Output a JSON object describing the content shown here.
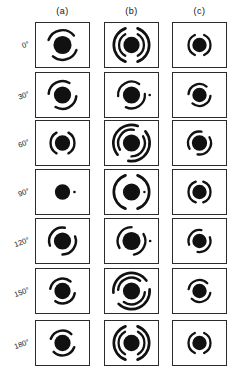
{
  "figure": {
    "type": "image-grid",
    "columns": [
      {
        "key": "a",
        "label": "(a)"
      },
      {
        "key": "b",
        "label": "(b)"
      },
      {
        "key": "c",
        "label": "(c)"
      }
    ],
    "rows": [
      {
        "angle_label": "0°"
      },
      {
        "angle_label": "30°"
      },
      {
        "angle_label": "60°"
      },
      {
        "angle_label": "90°"
      },
      {
        "angle_label": "120°"
      },
      {
        "angle_label": "150°"
      },
      {
        "angle_label": "180°"
      }
    ],
    "colors": {
      "ink": "#111111",
      "frame": "#2b2b2b",
      "background": "#ffffff"
    },
    "geometry": {
      "panel_width": 55,
      "panel_height": 46,
      "col_x": [
        35,
        104,
        172
      ],
      "row_y": [
        22,
        72,
        120,
        169,
        218,
        268,
        320
      ],
      "header_y": 6
    },
    "patterns": [
      {
        "row": 0,
        "col": "a",
        "core": 9.5,
        "rings": [
          {
            "r": 15.5,
            "w": 2.6,
            "start": 200,
            "sweep": 120
          },
          {
            "r": 15.5,
            "w": 2.6,
            "start": 20,
            "sweep": 110
          }
        ]
      },
      {
        "row": 0,
        "col": "b",
        "core": 8.5,
        "rings": [
          {
            "r": 13.0,
            "w": 2.4,
            "start": 120,
            "sweep": 120
          },
          {
            "r": 13.0,
            "w": 2.4,
            "start": 300,
            "sweep": 120
          },
          {
            "r": 18.5,
            "w": 2.8,
            "start": 110,
            "sweep": 140
          },
          {
            "r": 18.5,
            "w": 2.8,
            "start": 290,
            "sweep": 140
          }
        ]
      },
      {
        "row": 0,
        "col": "c",
        "core": 7.5,
        "rings": [
          {
            "r": 11.5,
            "w": 2.4,
            "start": 115,
            "sweep": 130
          },
          {
            "r": 11.5,
            "w": 2.4,
            "start": 295,
            "sweep": 130
          }
        ]
      },
      {
        "row": 1,
        "col": "a",
        "core": 9.0,
        "rings": [
          {
            "r": 14.5,
            "w": 2.6,
            "start": 185,
            "sweep": 115
          },
          {
            "r": 14.5,
            "w": 2.6,
            "start": 5,
            "sweep": 115
          }
        ]
      },
      {
        "row": 1,
        "col": "b",
        "core": 9.0,
        "rings": [
          {
            "r": 14.0,
            "w": 2.4,
            "start": 175,
            "sweep": 130
          },
          {
            "r": 14.0,
            "w": 2.4,
            "start": 355,
            "sweep": 120
          },
          {
            "r": 19.0,
            "w": 2.8,
            "start": 0,
            "sweep": 360
          }
        ]
      },
      {
        "row": 1,
        "col": "c",
        "core": 7.5,
        "rings": [
          {
            "r": 11.5,
            "w": 2.4,
            "start": 185,
            "sweep": 125
          },
          {
            "r": 11.5,
            "w": 2.4,
            "start": 5,
            "sweep": 125
          }
        ]
      },
      {
        "row": 2,
        "col": "a",
        "core": 8.0,
        "rings": [
          {
            "r": 12.5,
            "w": 2.5,
            "start": 120,
            "sweep": 120
          },
          {
            "r": 12.5,
            "w": 2.5,
            "start": 300,
            "sweep": 120
          }
        ]
      },
      {
        "row": 2,
        "col": "b",
        "core": 9.0,
        "rings": [
          {
            "r": 14.0,
            "w": 2.5,
            "start": 150,
            "sweep": 130
          },
          {
            "r": 14.0,
            "w": 2.5,
            "start": 330,
            "sweep": 120
          },
          {
            "r": 19.0,
            "w": 2.8,
            "start": 140,
            "sweep": 150
          },
          {
            "r": 19.0,
            "w": 2.8,
            "start": 320,
            "sweep": 140
          }
        ]
      },
      {
        "row": 2,
        "col": "c",
        "core": 8.0,
        "rings": [
          {
            "r": 12.0,
            "w": 2.4,
            "start": 150,
            "sweep": 130
          },
          {
            "r": 12.0,
            "w": 2.4,
            "start": 330,
            "sweep": 130
          }
        ]
      },
      {
        "row": 3,
        "col": "a",
        "core": 8.0,
        "rings": [
          {
            "r": 12.5,
            "w": 2.8,
            "start": 0,
            "sweep": 360
          }
        ]
      },
      {
        "row": 3,
        "col": "b",
        "core": 9.0,
        "rings": [
          {
            "r": 13.5,
            "w": 2.5,
            "start": 0,
            "sweep": 360
          },
          {
            "r": 18.5,
            "w": 2.8,
            "start": 110,
            "sweep": 140
          },
          {
            "r": 18.5,
            "w": 2.8,
            "start": 290,
            "sweep": 140
          }
        ]
      },
      {
        "row": 3,
        "col": "c",
        "core": 7.5,
        "rings": [
          {
            "r": 11.5,
            "w": 2.4,
            "start": 110,
            "sweep": 140
          },
          {
            "r": 11.5,
            "w": 2.4,
            "start": 290,
            "sweep": 140
          }
        ]
      },
      {
        "row": 4,
        "col": "a",
        "core": 9.0,
        "rings": [
          {
            "r": 14.0,
            "w": 2.6,
            "start": 160,
            "sweep": 120
          },
          {
            "r": 14.0,
            "w": 2.6,
            "start": 340,
            "sweep": 110
          }
        ]
      },
      {
        "row": 4,
        "col": "b",
        "core": 9.5,
        "rings": [
          {
            "r": 14.5,
            "w": 2.5,
            "start": 150,
            "sweep": 120
          },
          {
            "r": 14.5,
            "w": 2.5,
            "start": 330,
            "sweep": 110
          },
          {
            "r": 19.5,
            "w": 2.8,
            "start": 0,
            "sweep": 360
          }
        ]
      },
      {
        "row": 4,
        "col": "c",
        "core": 7.5,
        "rings": [
          {
            "r": 11.5,
            "w": 2.4,
            "start": 160,
            "sweep": 120
          },
          {
            "r": 11.5,
            "w": 2.4,
            "start": 340,
            "sweep": 120
          }
        ]
      },
      {
        "row": 5,
        "col": "a",
        "core": 8.5,
        "rings": [
          {
            "r": 13.0,
            "w": 2.6,
            "start": 190,
            "sweep": 120
          },
          {
            "r": 13.0,
            "w": 2.6,
            "start": 10,
            "sweep": 115
          }
        ]
      },
      {
        "row": 5,
        "col": "b",
        "core": 9.0,
        "rings": [
          {
            "r": 14.0,
            "w": 2.5,
            "start": 185,
            "sweep": 125
          },
          {
            "r": 14.0,
            "w": 2.5,
            "start": 5,
            "sweep": 120
          },
          {
            "r": 19.0,
            "w": 2.8,
            "start": 175,
            "sweep": 150
          },
          {
            "r": 19.0,
            "w": 2.8,
            "start": 355,
            "sweep": 140
          }
        ]
      },
      {
        "row": 5,
        "col": "c",
        "core": 7.5,
        "rings": [
          {
            "r": 11.5,
            "w": 2.4,
            "start": 190,
            "sweep": 125
          },
          {
            "r": 11.5,
            "w": 2.4,
            "start": 10,
            "sweep": 125
          }
        ]
      },
      {
        "row": 6,
        "col": "a",
        "core": 8.5,
        "rings": [
          {
            "r": 13.0,
            "w": 2.6,
            "start": 200,
            "sweep": 115
          },
          {
            "r": 13.0,
            "w": 2.6,
            "start": 20,
            "sweep": 115
          }
        ]
      },
      {
        "row": 6,
        "col": "b",
        "core": 8.5,
        "rings": [
          {
            "r": 13.5,
            "w": 2.4,
            "start": 120,
            "sweep": 120
          },
          {
            "r": 13.5,
            "w": 2.4,
            "start": 300,
            "sweep": 120
          },
          {
            "r": 18.5,
            "w": 2.8,
            "start": 110,
            "sweep": 140
          },
          {
            "r": 18.5,
            "w": 2.8,
            "start": 290,
            "sweep": 140
          }
        ]
      },
      {
        "row": 6,
        "col": "c",
        "core": 7.5,
        "rings": [
          {
            "r": 11.5,
            "w": 2.4,
            "start": 115,
            "sweep": 130
          },
          {
            "r": 11.5,
            "w": 2.4,
            "start": 295,
            "sweep": 130
          }
        ]
      }
    ]
  }
}
